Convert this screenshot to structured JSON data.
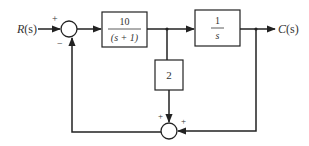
{
  "diagram": {
    "type": "block-diagram",
    "input_label": "R(s)",
    "output_label": "C(s)",
    "summing_junction_1": {
      "plus_sign": "+",
      "minus_sign": "−"
    },
    "summing_junction_2": {
      "left_sign": "+",
      "right_sign": "+"
    },
    "block_1": {
      "numerator": "10",
      "denominator": "(s + 1)"
    },
    "block_2": {
      "numerator": "1",
      "denominator": "s"
    },
    "block_3": {
      "gain": "2"
    },
    "colors": {
      "line": "#222222",
      "box_fill": "#ffffff",
      "text": "#333333"
    }
  }
}
